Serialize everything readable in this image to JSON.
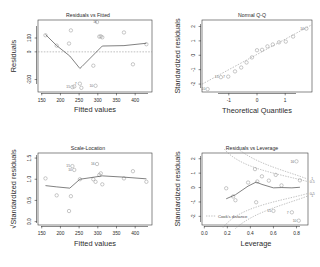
{
  "figure": {
    "kind": "lm-diagnostic-2x2",
    "background": "#ffffff",
    "point_color": "#9a9a9a",
    "line_color": "#4a4a4a",
    "dash_color": "#8e8e8e"
  },
  "chart_data": [
    {
      "id": "residuals-vs-fitted",
      "type": "scatter",
      "title": "Residuals vs Fitted",
      "xlabel": "Fitted values",
      "ylabel": "Residuals",
      "xlim": [
        140,
        445
      ],
      "ylim": [
        -290,
        230
      ],
      "xticks": [
        150,
        200,
        250,
        300,
        350,
        400
      ],
      "yticks": [
        -200,
        0,
        100
      ],
      "xticklabels": [
        "150",
        "200",
        "250",
        "300",
        "350",
        "400"
      ],
      "yticklabels": [
        "-200",
        "0",
        "100"
      ],
      "grid": false,
      "legend": "",
      "x": [
        160,
        190,
        223,
        228,
        232,
        237,
        252,
        256,
        288,
        294,
        298,
        304,
        308,
        312,
        370,
        394,
        430
      ],
      "y": [
        120,
        45,
        60,
        155,
        -255,
        -250,
        -230,
        -260,
        -100,
        -245,
        215,
        110,
        112,
        105,
        140,
        -90,
        55
      ],
      "labels": [
        {
          "text": "15",
          "x": 232,
          "y": -255
        },
        {
          "text": "7",
          "x": 252,
          "y": -230
        },
        {
          "text": "10",
          "x": 294,
          "y": -245
        },
        {
          "text": "16",
          "x": 304,
          "y": 215
        }
      ],
      "smoother": {
        "name": "lowess",
        "x": [
          160,
          190,
          225,
          252,
          258,
          312,
          370,
          430
        ],
        "y": [
          125,
          45,
          -30,
          -120,
          -105,
          42,
          45,
          62
        ]
      },
      "zero_line": 0
    },
    {
      "id": "normal-qq",
      "type": "scatter",
      "title": "Normal Q-Q",
      "xlabel": "Theoretical Quantiles",
      "ylabel": "Standardized residuals",
      "xlim": [
        -1.95,
        1.95
      ],
      "ylim": [
        -2.55,
        2.45
      ],
      "xticks": [
        -1,
        0,
        1
      ],
      "yticks": [
        -2,
        -1,
        0,
        1,
        2
      ],
      "xticklabels": [
        "-1",
        "0",
        "1"
      ],
      "yticklabels": [
        "-2",
        "-1",
        "0",
        "1",
        "2"
      ],
      "grid": false,
      "legend": "",
      "x": [
        -1.75,
        -1.28,
        -1.02,
        -0.78,
        -0.56,
        -0.37,
        -0.18,
        0.0,
        0.18,
        0.37,
        0.56,
        0.78,
        1.02,
        1.28,
        1.75
      ],
      "y": [
        -2.35,
        -1.52,
        -1.48,
        -1.12,
        -0.85,
        -0.5,
        -0.15,
        0.35,
        0.38,
        0.62,
        0.75,
        0.9,
        0.95,
        1.3,
        1.85
      ],
      "labels": [
        {
          "text": "10",
          "x": -1.75,
          "y": -2.35
        },
        {
          "text": "15",
          "x": -1.28,
          "y": -1.52
        },
        {
          "text": "7",
          "x": -1.02,
          "y": -1.48
        },
        {
          "text": "16",
          "x": 1.75,
          "y": 1.85
        }
      ],
      "reference_line": {
        "slope": 1.06,
        "intercept": 0.06
      }
    },
    {
      "id": "scale-location",
      "type": "scatter",
      "title": "Scale-Location",
      "xlabel": "Fitted values",
      "ylabel": "√Standardized residuals",
      "xlim": [
        140,
        445
      ],
      "ylim": [
        -0.08,
        1.62
      ],
      "xticks": [
        150,
        200,
        250,
        300,
        350,
        400
      ],
      "yticks": [
        0.0,
        0.5,
        1.0,
        1.5
      ],
      "xticklabels": [
        "150",
        "200",
        "250",
        "300",
        "350",
        "400"
      ],
      "yticklabels": [
        "0.0",
        "0.5",
        "1.0",
        "1.5"
      ],
      "grid": false,
      "legend": "",
      "x": [
        160,
        190,
        223,
        228,
        232,
        237,
        252,
        288,
        294,
        298,
        304,
        308,
        312,
        370,
        394,
        430
      ],
      "y": [
        1.02,
        0.62,
        0.25,
        0.6,
        1.31,
        1.22,
        1.0,
        1.0,
        0.94,
        1.36,
        1.1,
        1.14,
        0.88,
        1.02,
        1.19,
        0.94
      ],
      "labels": [
        {
          "text": "15",
          "x": 232,
          "y": 1.31
        },
        {
          "text": "10",
          "x": 237,
          "y": 1.22
        },
        {
          "text": "16",
          "x": 298,
          "y": 1.36
        }
      ],
      "smoother": {
        "name": "lowess",
        "x": [
          160,
          190,
          225,
          252,
          290,
          312,
          370,
          430
        ],
        "y": [
          0.85,
          0.82,
          0.79,
          1.0,
          1.05,
          1.08,
          1.05,
          1.01
        ]
      }
    },
    {
      "id": "residuals-vs-leverage",
      "type": "scatter",
      "title": "Residuals vs Leverage",
      "xlabel": "Leverage",
      "ylabel": "Standardized residuals",
      "xlim": [
        -0.02,
        0.9
      ],
      "ylim": [
        -2.6,
        2.4
      ],
      "xticks": [
        0.0,
        0.2,
        0.4,
        0.6,
        0.8
      ],
      "yticks": [
        -2,
        -1,
        0,
        1,
        2
      ],
      "xticklabels": [
        "0.0",
        "0.2",
        "0.4",
        "0.6",
        "0.8"
      ],
      "yticklabels": [
        "-2",
        "-1",
        "0",
        "1",
        "2"
      ],
      "grid": false,
      "legend_label": "Cook's distance",
      "contour_labels": [
        "1",
        "0.5",
        "0.5",
        "1"
      ],
      "x": [
        0.19,
        0.25,
        0.27,
        0.38,
        0.44,
        0.45,
        0.46,
        0.5,
        0.56,
        0.6,
        0.62,
        0.67,
        0.76,
        0.8,
        0.82,
        0.83
      ],
      "y": [
        -0.05,
        -0.62,
        -0.88,
        0.35,
        1.28,
        -1.02,
        0.42,
        0.78,
        0.48,
        -1.62,
        0.88,
        0.15,
        -1.72,
        1.82,
        -2.3,
        0.5
      ],
      "labels": [
        {
          "text": "15",
          "x": 0.6,
          "y": -1.62
        },
        {
          "text": "7",
          "x": 0.76,
          "y": -1.72
        },
        {
          "text": "16",
          "x": 0.8,
          "y": 1.82
        },
        {
          "text": "10",
          "x": 0.82,
          "y": -2.3
        }
      ],
      "smoother": {
        "name": "lowess",
        "x": [
          0.19,
          0.27,
          0.38,
          0.45,
          0.5,
          0.6,
          0.67,
          0.76,
          0.83
        ],
        "y": [
          -0.78,
          -0.5,
          0.1,
          0.38,
          0.22,
          -0.02,
          0.0,
          -0.02,
          0.02
        ]
      },
      "cook_levels": [
        0.5,
        1.0
      ]
    }
  ]
}
